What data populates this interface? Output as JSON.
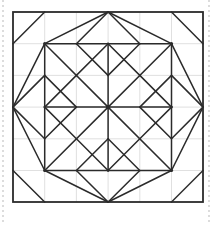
{
  "figure": {
    "canvas": {
      "width": 215,
      "height": 225
    },
    "colors": {
      "background": "#ffffff",
      "pattern_stroke": "#2b2b2b",
      "grid_stroke": "#d8d8d8",
      "border_stroke": "#2b2b2b",
      "margin_guide_stroke": "#b9b9b9"
    },
    "stroke_widths": {
      "pattern": 1.5,
      "grid": 0.8,
      "border": 1.8,
      "margin_guide": 1
    }
  },
  "grid": {
    "label": "construction grid",
    "columns": 6,
    "rows": 6,
    "origin_x": 13,
    "origin_y": 12,
    "cell_size": 31.7,
    "extent_x": 203,
    "extent_y": 202,
    "visible": true,
    "vertical_lines_x": [
      44.7,
      76.4,
      108.1,
      139.8,
      171.5
    ],
    "horizontal_lines_y": [
      43.7,
      75.4,
      107.1,
      138.8,
      170.5
    ]
  },
  "border": {
    "label": "outer block border",
    "x": 13,
    "y": 12,
    "width": 190,
    "height": 190
  },
  "margin_guides": {
    "label": "page margin guides",
    "style": "dashed",
    "dash_pattern": "2 3",
    "left_x": 3,
    "right_x": 209,
    "top_y": 0,
    "bottom_y": 225
  },
  "pattern": {
    "center_point": {
      "x": 108.1,
      "y": 107.1
    },
    "star_points": 8,
    "segments": [
      {
        "name": "center-spoke-up",
        "x1": 108.1,
        "y1": 107.1,
        "x2": 108.1,
        "y2": 43.7
      },
      {
        "name": "center-spoke-down",
        "x1": 108.1,
        "y1": 107.1,
        "x2": 108.1,
        "y2": 170.5
      },
      {
        "name": "center-spoke-left",
        "x1": 108.1,
        "y1": 107.1,
        "x2": 44.7,
        "y2": 107.1
      },
      {
        "name": "center-spoke-right",
        "x1": 108.1,
        "y1": 107.1,
        "x2": 171.5,
        "y2": 107.1
      },
      {
        "name": "center-spoke-up-left",
        "x1": 108.1,
        "y1": 107.1,
        "x2": 44.7,
        "y2": 43.7
      },
      {
        "name": "center-spoke-up-right",
        "x1": 108.1,
        "y1": 107.1,
        "x2": 171.5,
        "y2": 43.7
      },
      {
        "name": "center-spoke-down-left",
        "x1": 108.1,
        "y1": 107.1,
        "x2": 44.7,
        "y2": 170.5
      },
      {
        "name": "center-spoke-down-right",
        "x1": 108.1,
        "y1": 107.1,
        "x2": 171.5,
        "y2": 170.5
      },
      {
        "name": "inner-star-up-left-edge",
        "x1": 108.1,
        "y1": 43.7,
        "x2": 76.4,
        "y2": 75.4
      },
      {
        "name": "inner-star-up-right-edge",
        "x1": 108.1,
        "y1": 43.7,
        "x2": 139.8,
        "y2": 75.4
      },
      {
        "name": "inner-star-left-up-edge",
        "x1": 44.7,
        "y1": 107.1,
        "x2": 76.4,
        "y2": 75.4
      },
      {
        "name": "inner-star-left-down-edge",
        "x1": 44.7,
        "y1": 107.1,
        "x2": 76.4,
        "y2": 138.8
      },
      {
        "name": "inner-star-right-up-edge",
        "x1": 171.5,
        "y1": 107.1,
        "x2": 139.8,
        "y2": 75.4
      },
      {
        "name": "inner-star-right-down-edge",
        "x1": 171.5,
        "y1": 107.1,
        "x2": 139.8,
        "y2": 138.8
      },
      {
        "name": "inner-star-down-left-edge",
        "x1": 108.1,
        "y1": 170.5,
        "x2": 76.4,
        "y2": 138.8
      },
      {
        "name": "inner-star-down-right-edge",
        "x1": 108.1,
        "y1": 170.5,
        "x2": 139.8,
        "y2": 138.8
      },
      {
        "name": "top-diamond-left-upper",
        "x1": 44.7,
        "y1": 43.7,
        "x2": 108.1,
        "y2": 12
      },
      {
        "name": "top-diamond-right-upper",
        "x1": 171.5,
        "y1": 43.7,
        "x2": 108.1,
        "y2": 12
      },
      {
        "name": "left-diamond-upper",
        "x1": 44.7,
        "y1": 43.7,
        "x2": 13,
        "y2": 107.1
      },
      {
        "name": "left-diamond-lower",
        "x1": 44.7,
        "y1": 170.5,
        "x2": 13,
        "y2": 107.1
      },
      {
        "name": "right-diamond-upper",
        "x1": 171.5,
        "y1": 43.7,
        "x2": 203,
        "y2": 107.1
      },
      {
        "name": "right-diamond-lower",
        "x1": 171.5,
        "y1": 170.5,
        "x2": 203,
        "y2": 107.1
      },
      {
        "name": "bottom-diamond-left-lower",
        "x1": 44.7,
        "y1": 170.5,
        "x2": 108.1,
        "y2": 202
      },
      {
        "name": "bottom-diamond-right-lower",
        "x1": 171.5,
        "y1": 170.5,
        "x2": 108.1,
        "y2": 202
      },
      {
        "name": "top-left-node-h-right",
        "x1": 44.7,
        "y1": 43.7,
        "x2": 108.1,
        "y2": 43.7
      },
      {
        "name": "top-right-node-h-left",
        "x1": 171.5,
        "y1": 43.7,
        "x2": 108.1,
        "y2": 43.7
      },
      {
        "name": "bottom-left-node-h-right",
        "x1": 44.7,
        "y1": 170.5,
        "x2": 108.1,
        "y2": 170.5
      },
      {
        "name": "bottom-right-node-h-left",
        "x1": 171.5,
        "y1": 170.5,
        "x2": 108.1,
        "y2": 170.5
      },
      {
        "name": "top-left-node-v-down",
        "x1": 44.7,
        "y1": 43.7,
        "x2": 44.7,
        "y2": 107.1
      },
      {
        "name": "top-right-node-v-down",
        "x1": 171.5,
        "y1": 43.7,
        "x2": 171.5,
        "y2": 107.1
      },
      {
        "name": "bottom-left-node-v-up",
        "x1": 44.7,
        "y1": 170.5,
        "x2": 44.7,
        "y2": 107.1
      },
      {
        "name": "bottom-right-node-v-up",
        "x1": 171.5,
        "y1": 170.5,
        "x2": 171.5,
        "y2": 107.1
      },
      {
        "name": "left-mid-diamond-nw",
        "x1": 13,
        "y1": 107.1,
        "x2": 44.7,
        "y2": 75.4
      },
      {
        "name": "left-mid-diamond-ne",
        "x1": 44.7,
        "y1": 75.4,
        "x2": 76.4,
        "y2": 107.1
      },
      {
        "name": "left-mid-diamond-se",
        "x1": 76.4,
        "y1": 107.1,
        "x2": 44.7,
        "y2": 138.8
      },
      {
        "name": "left-mid-diamond-sw",
        "x1": 44.7,
        "y1": 138.8,
        "x2": 13,
        "y2": 107.1
      },
      {
        "name": "right-mid-diamond-ne",
        "x1": 203,
        "y1": 107.1,
        "x2": 171.5,
        "y2": 75.4
      },
      {
        "name": "right-mid-diamond-nw",
        "x1": 171.5,
        "y1": 75.4,
        "x2": 139.8,
        "y2": 107.1
      },
      {
        "name": "right-mid-diamond-sw",
        "x1": 139.8,
        "y1": 107.1,
        "x2": 171.5,
        "y2": 138.8
      },
      {
        "name": "right-mid-diamond-se",
        "x1": 171.5,
        "y1": 138.8,
        "x2": 203,
        "y2": 107.1
      },
      {
        "name": "top-mid-diamond-nw",
        "x1": 108.1,
        "y1": 12,
        "x2": 76.4,
        "y2": 43.7
      },
      {
        "name": "top-mid-diamond-sw",
        "x1": 76.4,
        "y1": 43.7,
        "x2": 108.1,
        "y2": 75.4
      },
      {
        "name": "top-mid-diamond-se",
        "x1": 108.1,
        "y1": 75.4,
        "x2": 139.8,
        "y2": 43.7
      },
      {
        "name": "top-mid-diamond-ne",
        "x1": 139.8,
        "y1": 43.7,
        "x2": 108.1,
        "y2": 12
      },
      {
        "name": "bottom-mid-diamond-sw",
        "x1": 108.1,
        "y1": 202,
        "x2": 76.4,
        "y2": 170.5
      },
      {
        "name": "bottom-mid-diamond-nw",
        "x1": 76.4,
        "y1": 170.5,
        "x2": 108.1,
        "y2": 138.8
      },
      {
        "name": "bottom-mid-diamond-ne",
        "x1": 108.1,
        "y1": 138.8,
        "x2": 139.8,
        "y2": 170.5
      },
      {
        "name": "bottom-mid-diamond-se",
        "x1": 139.8,
        "y1": 170.5,
        "x2": 108.1,
        "y2": 202
      },
      {
        "name": "corner-tl-diagonal",
        "x1": 13,
        "y1": 43.7,
        "x2": 44.7,
        "y2": 12
      },
      {
        "name": "corner-tr-diagonal",
        "x1": 203,
        "y1": 43.7,
        "x2": 171.5,
        "y2": 12
      },
      {
        "name": "corner-bl-diagonal",
        "x1": 13,
        "y1": 170.5,
        "x2": 44.7,
        "y2": 202
      },
      {
        "name": "corner-br-diagonal",
        "x1": 203,
        "y1": 170.5,
        "x2": 171.5,
        "y2": 202
      }
    ],
    "nodes": [
      {
        "name": "center-node",
        "x": 108.1,
        "y": 107.1,
        "r": 2.2
      },
      {
        "name": "top-left-node",
        "x": 44.7,
        "y": 43.7,
        "r": 1.6
      },
      {
        "name": "top-right-node",
        "x": 171.5,
        "y": 43.7,
        "r": 1.6
      },
      {
        "name": "bottom-left-node",
        "x": 44.7,
        "y": 170.5,
        "r": 1.6
      },
      {
        "name": "bottom-right-node",
        "x": 171.5,
        "y": 170.5,
        "r": 1.6
      },
      {
        "name": "top-mid-node",
        "x": 108.1,
        "y": 43.7,
        "r": 1.3
      },
      {
        "name": "bottom-mid-node",
        "x": 108.1,
        "y": 170.5,
        "r": 1.3
      },
      {
        "name": "left-mid-node",
        "x": 44.7,
        "y": 107.1,
        "r": 1.3
      },
      {
        "name": "right-mid-node",
        "x": 171.5,
        "y": 107.1,
        "r": 1.3
      }
    ]
  }
}
